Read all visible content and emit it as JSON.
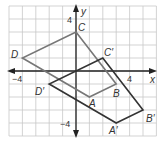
{
  "diagram": {
    "type": "coordinate-plane-transformation",
    "grid": {
      "x_min": -5,
      "x_max": 6,
      "y_min": -5,
      "y_max": 5,
      "origin_px": [
        76,
        71
      ],
      "unit_px_x": 13.4,
      "unit_px_y": 13.0,
      "grid_color": "#c8c8c8",
      "axis_color": "#222222"
    },
    "axes": {
      "x_label": "x",
      "y_label": "y",
      "tick_labels": {
        "x_neg": "−4",
        "x_pos": "4",
        "y_pos": "4",
        "y_neg": "−4"
      }
    },
    "polygons": [
      {
        "name": "ABCD",
        "color": "#777777",
        "vertices": [
          {
            "label": "A",
            "x": 1,
            "y": -2
          },
          {
            "label": "B",
            "x": 3,
            "y": -1
          },
          {
            "label": "C",
            "x": 0,
            "y": 3
          },
          {
            "label": "D",
            "x": -4,
            "y": 1
          }
        ]
      },
      {
        "name": "A'B'C'D'",
        "color": "#333333",
        "vertices": [
          {
            "label": "A′",
            "x": 3,
            "y": -4
          },
          {
            "label": "B′",
            "x": 5,
            "y": -3
          },
          {
            "label": "C′",
            "x": 2,
            "y": 1
          },
          {
            "label": "D′",
            "x": -2,
            "y": -1
          }
        ]
      }
    ],
    "labels": {
      "A": "A",
      "B": "B",
      "C": "C",
      "D": "D",
      "A_prime": "A′",
      "B_prime": "B′",
      "C_prime": "C′",
      "D_prime": "D′"
    }
  }
}
